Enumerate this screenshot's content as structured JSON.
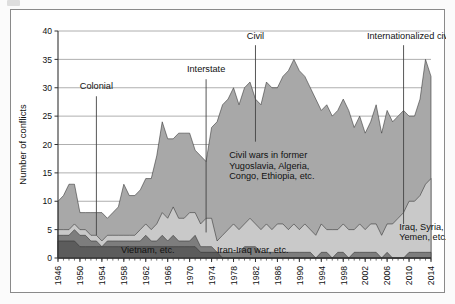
{
  "figure": {
    "background_color": "#ffffff",
    "frame_color": "#8a8a8a"
  },
  "chart_data": {
    "type": "area",
    "stacked": true,
    "title": "",
    "subtitle": "",
    "xlabel": "",
    "ylabel": "Number of conflicts",
    "xlim": [
      1946,
      2014
    ],
    "ylim": [
      0,
      40
    ],
    "yticks": [
      0,
      5,
      10,
      15,
      20,
      25,
      30,
      35,
      40
    ],
    "xticks": [
      1946,
      1950,
      1954,
      1958,
      1962,
      1966,
      1970,
      1974,
      1978,
      1982,
      1986,
      1990,
      1994,
      1998,
      2002,
      2006,
      2010,
      2014
    ],
    "xtick_rotation": 90,
    "grid": "horizontal",
    "legend_position": "none",
    "x": [
      1946,
      1947,
      1948,
      1949,
      1950,
      1951,
      1952,
      1953,
      1954,
      1955,
      1956,
      1957,
      1958,
      1959,
      1960,
      1961,
      1962,
      1963,
      1964,
      1965,
      1966,
      1967,
      1968,
      1969,
      1970,
      1971,
      1972,
      1973,
      1974,
      1975,
      1976,
      1977,
      1978,
      1979,
      1980,
      1981,
      1982,
      1983,
      1984,
      1985,
      1986,
      1987,
      1988,
      1989,
      1990,
      1991,
      1992,
      1993,
      1994,
      1995,
      1996,
      1997,
      1998,
      1999,
      2000,
      2001,
      2002,
      2003,
      2004,
      2005,
      2006,
      2007,
      2008,
      2009,
      2010,
      2011,
      2012,
      2013,
      2014
    ],
    "series": [
      {
        "name": "Colonial",
        "color": "#5c5c5c",
        "stack_order": 1,
        "values": [
          3,
          3,
          3,
          3,
          2,
          2,
          2,
          2,
          2,
          2,
          2,
          2,
          2,
          2,
          2,
          2,
          2,
          2,
          2,
          2,
          2,
          2,
          2,
          2,
          2,
          2,
          1,
          1,
          1,
          1,
          0,
          0,
          0,
          0,
          0,
          0,
          0,
          0,
          0,
          0,
          0,
          0,
          0,
          0,
          0,
          0,
          0,
          0,
          0,
          0,
          0,
          0,
          0,
          0,
          0,
          0,
          0,
          0,
          0,
          0,
          0,
          0,
          0,
          0,
          0,
          0,
          0,
          0,
          0
        ]
      },
      {
        "name": "Interstate",
        "color": "#7d7d7d",
        "stack_order": 2,
        "values": [
          1,
          1,
          1,
          2,
          2,
          2,
          1,
          1,
          0,
          1,
          1,
          1,
          1,
          1,
          1,
          1,
          2,
          1,
          1,
          2,
          1,
          2,
          1,
          1,
          1,
          2,
          1,
          1,
          1,
          0,
          1,
          1,
          1,
          1,
          2,
          2,
          2,
          1,
          1,
          1,
          1,
          1,
          1,
          1,
          1,
          1,
          1,
          0,
          1,
          1,
          0,
          1,
          1,
          0,
          1,
          1,
          1,
          1,
          1,
          0,
          1,
          0,
          0,
          0,
          1,
          1,
          1,
          1,
          1
        ]
      },
      {
        "name": "Internationalized civil",
        "color": "#c9c9c9",
        "stack_order": 3,
        "values": [
          1,
          1,
          1,
          1,
          1,
          1,
          1,
          1,
          1,
          1,
          1,
          1,
          1,
          1,
          1,
          2,
          2,
          2,
          3,
          4,
          4,
          5,
          4,
          4,
          5,
          4,
          4,
          5,
          5,
          2,
          3,
          4,
          5,
          4,
          4,
          5,
          4,
          4,
          5,
          4,
          5,
          5,
          4,
          5,
          4,
          5,
          4,
          4,
          5,
          4,
          5,
          4,
          5,
          5,
          4,
          5,
          4,
          5,
          5,
          4,
          5,
          6,
          7,
          8,
          9,
          9,
          10,
          12,
          13
        ]
      },
      {
        "name": "Civil",
        "color": "#a8a8a8",
        "stack_order": 4,
        "values": [
          5,
          6,
          8,
          7,
          3,
          3,
          4,
          4,
          5,
          3,
          4,
          5,
          9,
          7,
          7,
          7,
          8,
          9,
          12,
          16,
          14,
          12,
          15,
          15,
          14,
          11,
          12,
          10,
          16,
          21,
          23,
          23,
          24,
          22,
          24,
          24,
          22,
          22,
          25,
          25,
          24,
          26,
          28,
          29,
          28,
          26,
          25,
          24,
          20,
          22,
          20,
          21,
          22,
          21,
          18,
          19,
          17,
          18,
          21,
          18,
          20,
          18,
          18,
          18,
          15,
          15,
          17,
          22,
          18
        ]
      }
    ],
    "totals": [
      10,
      11,
      13,
      13,
      8,
      8,
      8,
      8,
      8,
      7,
      8,
      9,
      13,
      11,
      11,
      12,
      14,
      14,
      18,
      24,
      21,
      21,
      22,
      22,
      22,
      19,
      18,
      17,
      23,
      24,
      27,
      28,
      30,
      27,
      30,
      31,
      28,
      27,
      31,
      30,
      30,
      32,
      33,
      35,
      33,
      32,
      30,
      28,
      26,
      27,
      25,
      26,
      28,
      26,
      23,
      25,
      22,
      24,
      27,
      22,
      26,
      24,
      25,
      26,
      25,
      25,
      28,
      35,
      32
    ],
    "annotations": [
      {
        "id": "colonial",
        "text": "Colonial",
        "pointer_year": 1953,
        "pointer_from_y": 28.5,
        "pointer_to_y": 4.0
      },
      {
        "id": "interstate",
        "text": "Interstate",
        "pointer_year": 1973,
        "pointer_from_y": 31.5,
        "pointer_to_y": 4.5
      },
      {
        "id": "civil",
        "text": "Civil",
        "pointer_year": 1982,
        "pointer_from_y": 37.5,
        "pointer_to_y": 20.5
      },
      {
        "id": "internationalized-civil",
        "text": "Internationalized civil",
        "pointer_year": 2009,
        "pointer_from_y": 37.5,
        "pointer_to_y": 6.0
      },
      {
        "id": "civil-wars-note",
        "text_lines": [
          "Civil wars in former",
          "Yugoslavia, Algeria,",
          "Congo, Ethiopia, etc."
        ]
      },
      {
        "id": "iraq-syria-note",
        "text_lines": [
          "Iraq, Syria,",
          "Yemen, etc."
        ]
      },
      {
        "id": "vietnam-note",
        "text": "Vietnam, etc."
      },
      {
        "id": "iran-iraq-note",
        "text": "Iran-Iraq war, etc."
      }
    ]
  }
}
